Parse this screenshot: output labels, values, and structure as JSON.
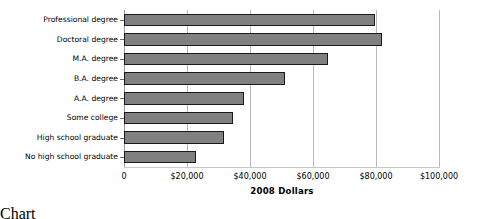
{
  "chart_data": {
    "type": "bar",
    "orientation": "horizontal",
    "title": "",
    "xlabel": "2008 Dollars",
    "ylabel": "",
    "categories": [
      "Professional degree",
      "Doctoral degree",
      "M.A. degree",
      "B.A. degree",
      "A.A. degree",
      "Some college",
      "High school graduate",
      "No high school graduate"
    ],
    "values": [
      79700,
      81900,
      64800,
      51100,
      38100,
      34600,
      31700,
      22900
    ],
    "xlim": [
      0,
      100000
    ],
    "xticks": [
      0,
      20000,
      40000,
      60000,
      80000,
      100000
    ],
    "xticklabels": [
      "0",
      "$20,000",
      "$40,000",
      "$60,000",
      "$80,000",
      "$100,000"
    ],
    "grid": true,
    "grid_axis": "x",
    "legend": false,
    "bar_color": "#808080",
    "bar_edge_color": "#1a1a1a",
    "gridline_color": "#b9b9b9"
  }
}
